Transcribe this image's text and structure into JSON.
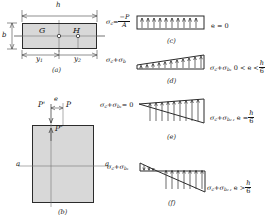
{
  "figure_a": {
    "caption": "(a)",
    "width_label": "h",
    "height_label": "b",
    "point_G": "G",
    "point_H": "H",
    "dim_left": "y",
    "dim_left_sub": "1",
    "dim_right": "y",
    "dim_right_sub": "2"
  },
  "figure_b": {
    "caption": "(b)",
    "load_left": "P'",
    "load_right": "P",
    "eccentricity": "e",
    "internal_force": "P″",
    "section_left": "a",
    "section_right": "a"
  },
  "figure_c": {
    "caption": "(c)",
    "left_formula_main": "σ",
    "left_formula_sub": "c",
    "left_formula_eq": "=",
    "left_numerator": "−P",
    "left_denominator": "A",
    "right_condition": "e = 0",
    "shape": "uniform-rectangle"
  },
  "figure_d": {
    "caption": "(d)",
    "left_label": "σ",
    "left_label_sub": "c",
    "left_label_plus": "+σ",
    "left_label_sub2": "b",
    "right_label": "σ",
    "right_label_sub": "c",
    "right_label_plus": "+σ",
    "right_label_sub2": "b₁",
    "right_condition": "0 < e <",
    "cond_num": "h",
    "cond_den": "6",
    "shape": "trapezoid"
  },
  "figure_e": {
    "caption": "(e)",
    "left_label": "σ",
    "left_label_sub": "c",
    "left_label_plus": "+σ",
    "left_label_sub2": "b₁",
    "left_label_eq": "= 0",
    "right_label": "σ",
    "right_label_sub": "c",
    "right_label_plus": "+σ",
    "right_label_sub2": "b₂",
    "right_condition": ", e =",
    "cond_num": "h",
    "cond_den": "6",
    "shape": "triangle"
  },
  "figure_f": {
    "caption": "(f)",
    "left_label": "σ",
    "left_label_sub": "c",
    "left_label_plus": "+σ",
    "left_label_sub2": "b₁",
    "right_label": "σ",
    "right_label_sub": "c",
    "right_label_plus": "+σ",
    "right_label_sub2": "b₂",
    "right_condition": ", e >",
    "cond_num": "h",
    "cond_den": "6",
    "shape": "double-triangle"
  },
  "colors": {
    "fill": "#d8d8d8",
    "outline": "#2b2b2b",
    "dim": "#444444",
    "axis": "#777777",
    "background": "#ffffff"
  }
}
